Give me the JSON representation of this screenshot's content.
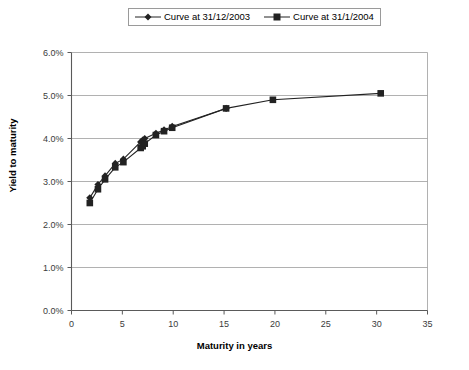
{
  "chart_data": {
    "type": "line",
    "title": "",
    "xlabel": "Maturity in years",
    "ylabel": "Yield to maturity",
    "xlim": [
      0,
      35
    ],
    "ylim": [
      0,
      6
    ],
    "xticks": [
      "0",
      "5",
      "10",
      "15",
      "20",
      "25",
      "30",
      "35"
    ],
    "xtick_values": [
      0,
      5,
      10,
      15,
      20,
      25,
      30,
      35
    ],
    "yticks": [
      "0.0%",
      "1.0%",
      "2.0%",
      "3.0%",
      "4.0%",
      "5.0%",
      "6.0%"
    ],
    "ytick_values": [
      0,
      1,
      2,
      3,
      4,
      5,
      6
    ],
    "grid": "horizontal",
    "legend_position": "top-center",
    "series": [
      {
        "name": "Curve at 31/12/2003",
        "marker": "diamond",
        "color": "#222222",
        "points": [
          {
            "x": 1.8,
            "y": 2.62
          },
          {
            "x": 2.6,
            "y": 2.93
          },
          {
            "x": 3.3,
            "y": 3.13
          },
          {
            "x": 4.3,
            "y": 3.42
          },
          {
            "x": 5.1,
            "y": 3.52
          },
          {
            "x": 6.8,
            "y": 3.92
          },
          {
            "x": 7.0,
            "y": 3.96
          },
          {
            "x": 7.2,
            "y": 4.0
          },
          {
            "x": 8.3,
            "y": 4.12
          },
          {
            "x": 9.1,
            "y": 4.2
          },
          {
            "x": 9.9,
            "y": 4.28
          },
          {
            "x": 15.2,
            "y": 4.7
          }
        ]
      },
      {
        "name": "Curve at 31/1/2004",
        "marker": "square",
        "color": "#222222",
        "points": [
          {
            "x": 1.8,
            "y": 2.5
          },
          {
            "x": 2.6,
            "y": 2.82
          },
          {
            "x": 3.3,
            "y": 3.05
          },
          {
            "x": 4.3,
            "y": 3.33
          },
          {
            "x": 5.1,
            "y": 3.45
          },
          {
            "x": 6.8,
            "y": 3.78
          },
          {
            "x": 7.0,
            "y": 3.82
          },
          {
            "x": 7.2,
            "y": 3.88
          },
          {
            "x": 8.3,
            "y": 4.08
          },
          {
            "x": 9.1,
            "y": 4.17
          },
          {
            "x": 9.9,
            "y": 4.25
          },
          {
            "x": 15.2,
            "y": 4.7
          },
          {
            "x": 19.8,
            "y": 4.9
          },
          {
            "x": 30.4,
            "y": 5.05
          }
        ]
      }
    ]
  },
  "legend": {
    "entries": [
      {
        "label": "Curve at 31/12/2003",
        "marker": "diamond"
      },
      {
        "label": "Curve at 31/1/2004",
        "marker": "square"
      }
    ]
  },
  "axes": {
    "x_title": "Maturity in years",
    "y_title": "Yield to maturity"
  }
}
